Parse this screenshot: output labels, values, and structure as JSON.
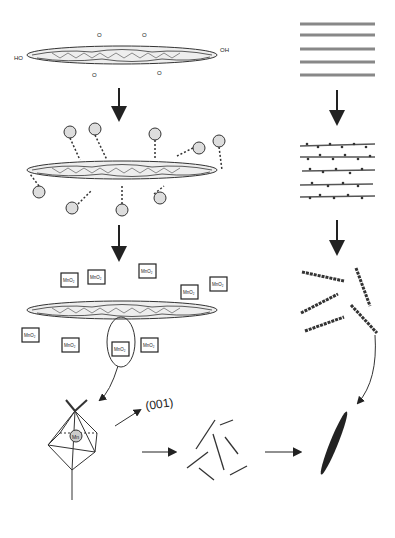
{
  "diagram": {
    "left_column": {
      "step1": {
        "name": "graphene-oxide-sheet",
        "groups": [
          "HO",
          "OH",
          "O",
          "H"
        ]
      },
      "step2": {
        "name": "mn2-adsorbed-sheet",
        "ion_label": "Mn²⁺",
        "groups": [
          "HO",
          "OH",
          "H"
        ]
      },
      "step3": {
        "name": "mno2-nucleated-sheet",
        "box_label": "MnO₂",
        "groups": [
          "HO",
          "OH",
          "H"
        ]
      },
      "step4": {
        "name": "mn-octahedron",
        "center_label": "Mn",
        "facet_label": "(001)",
        "ligand_labels": [
          "H₃C",
          "H₃C",
          "CH",
          "CH₃",
          "CH₃",
          "H",
          "H"
        ]
      }
    },
    "right_column": {
      "step1": {
        "name": "stacked-graphene-layers",
        "count": 5
      },
      "step2": {
        "name": "decorated-layers",
        "count": 5
      },
      "step3": {
        "name": "exfoliated-sheets"
      },
      "step4": {
        "name": "nanorod-assembly"
      },
      "step5": {
        "name": "ellipsoid-product"
      }
    }
  }
}
